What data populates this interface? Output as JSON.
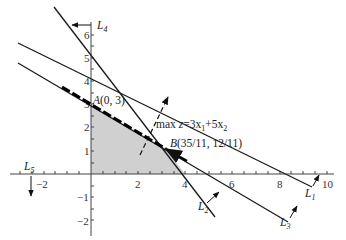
{
  "diagram": {
    "type": "linear-programming-graphical-solution",
    "axes": {
      "x_ticks": [
        {
          "value": -2,
          "label": "−2"
        },
        {
          "value": 2,
          "label": "2"
        },
        {
          "value": 4,
          "label": "4"
        },
        {
          "value": 6,
          "label": "6"
        },
        {
          "value": 8,
          "label": "8"
        },
        {
          "value": 10,
          "label": "10"
        }
      ],
      "y_ticks": [
        {
          "value": -2,
          "label": "−2"
        },
        {
          "value": -1,
          "label": "−1"
        },
        {
          "value": 1,
          "label": "1"
        },
        {
          "value": 2,
          "label": "2"
        },
        {
          "value": 3,
          "label": "3"
        },
        {
          "value": 4,
          "label": "4"
        },
        {
          "value": 5,
          "label": "5"
        },
        {
          "value": 6,
          "label": "6"
        }
      ]
    },
    "lines": {
      "L1": {
        "label": "L",
        "sub": "1"
      },
      "L2": {
        "label": "L",
        "sub": "2"
      },
      "L3": {
        "label": "L",
        "sub": "3"
      },
      "L4": {
        "label": "L",
        "sub": "4"
      },
      "L5": {
        "label": "L",
        "sub": "5"
      }
    },
    "points": {
      "A": {
        "name": "A",
        "coords": "(0, 3)"
      },
      "B": {
        "name": "B",
        "coords": "(35/11, 12/11)"
      }
    },
    "objective": {
      "prefix": "max ",
      "var": "z",
      "eq": "=3x",
      "sub1": "1",
      "plus": "+5x",
      "sub2": "2"
    },
    "colors": {
      "feasible_region": "#d0d0d0",
      "lines": "#1a1a1a"
    }
  }
}
